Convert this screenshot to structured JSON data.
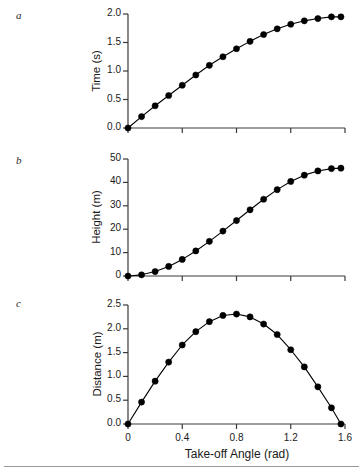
{
  "figure": {
    "xlabel": "Take-off Angle (rad)",
    "panel_letters": [
      "a",
      "b",
      "c"
    ],
    "line_color": "#000000",
    "marker_color": "#000000",
    "axis_color": "#3a3a3a"
  },
  "chart_data": [
    {
      "type": "line",
      "panel": "a",
      "title": "",
      "xlabel": "Take-off Angle (rad)",
      "ylabel": "Time (s)",
      "xlim": [
        0,
        1.6
      ],
      "ylim": [
        0,
        2.0
      ],
      "xticks": [
        0,
        0.4,
        0.8,
        1.2,
        1.6
      ],
      "xticklabels": [
        "0",
        "0.4",
        "0.8",
        "1.2",
        "1.6"
      ],
      "yticks": [
        0.0,
        0.5,
        1.0,
        1.5,
        2.0
      ],
      "yticklabels": [
        "0.0",
        "0.5",
        "1.0",
        "1.5",
        "2.0"
      ],
      "grid": false,
      "legend": "none",
      "markers": "filled-circle",
      "x": [
        0.0,
        0.1,
        0.2,
        0.3,
        0.4,
        0.5,
        0.6,
        0.7,
        0.8,
        0.9,
        1.0,
        1.1,
        1.2,
        1.3,
        1.4,
        1.5,
        1.57
      ],
      "values": [
        0.0,
        0.2,
        0.39,
        0.57,
        0.75,
        0.93,
        1.1,
        1.25,
        1.39,
        1.52,
        1.64,
        1.74,
        1.82,
        1.88,
        1.92,
        1.95,
        1.95
      ]
    },
    {
      "type": "line",
      "panel": "b",
      "title": "",
      "xlabel": "Take-off Angle (rad)",
      "ylabel": "Height (m)",
      "xlim": [
        0,
        1.6
      ],
      "ylim": [
        0,
        50
      ],
      "xticks": [
        0,
        0.4,
        0.8,
        1.2,
        1.6
      ],
      "xticklabels": [
        "0",
        "0.4",
        "0.8",
        "1.2",
        "1.6"
      ],
      "yticks": [
        0,
        10,
        20,
        30,
        40,
        50
      ],
      "yticklabels": [
        "0",
        "10",
        "20",
        "30",
        "40",
        "50"
      ],
      "grid": false,
      "legend": "none",
      "markers": "filled-circle",
      "x": [
        0.0,
        0.1,
        0.2,
        0.3,
        0.4,
        0.5,
        0.6,
        0.7,
        0.8,
        0.9,
        1.0,
        1.1,
        1.2,
        1.3,
        1.4,
        1.5,
        1.57
      ],
      "values": [
        0.0,
        0.5,
        1.9,
        4.1,
        7.1,
        10.7,
        14.8,
        19.2,
        23.7,
        28.3,
        32.8,
        36.9,
        40.4,
        43.1,
        44.9,
        45.9,
        46.1
      ]
    },
    {
      "type": "line",
      "panel": "c",
      "title": "",
      "xlabel": "Take-off Angle (rad)",
      "ylabel": "Distance (m)",
      "xlim": [
        0,
        1.6
      ],
      "ylim": [
        0,
        2.5
      ],
      "xticks": [
        0,
        0.4,
        0.8,
        1.2,
        1.6
      ],
      "xticklabels": [
        "0",
        "0.4",
        "0.8",
        "1.2",
        "1.6"
      ],
      "yticks": [
        0.0,
        0.5,
        1.0,
        1.5,
        2.0,
        2.5
      ],
      "yticklabels": [
        "0.0",
        "0.5",
        "1.0",
        "1.5",
        "2.0",
        "2.5"
      ],
      "grid": false,
      "legend": "none",
      "markers": "filled-circle",
      "x": [
        0.0,
        0.1,
        0.2,
        0.3,
        0.4,
        0.5,
        0.6,
        0.7,
        0.8,
        0.9,
        1.0,
        1.1,
        1.2,
        1.3,
        1.4,
        1.5,
        1.57
      ],
      "values": [
        0.0,
        0.46,
        0.9,
        1.3,
        1.66,
        1.94,
        2.15,
        2.28,
        2.31,
        2.25,
        2.1,
        1.88,
        1.56,
        1.2,
        0.78,
        0.34,
        0.0
      ]
    }
  ]
}
